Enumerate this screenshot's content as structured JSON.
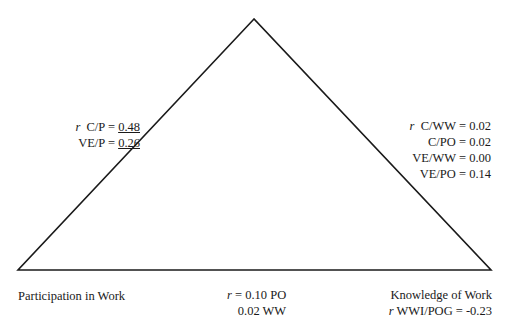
{
  "diagram": {
    "type": "triangle",
    "vertices": {
      "top": {
        "label": ""
      },
      "bottom_left": {
        "label": "Participation in Work"
      },
      "bottom_right": {
        "label": "Knowledge of Work"
      }
    },
    "line_color": "#1a1a1a"
  },
  "left_edge": {
    "r_symbol": "r",
    "rows": [
      {
        "name": "C/P = ",
        "value": "0.48",
        "underlined": true
      },
      {
        "name": "VE/P = ",
        "value": "0.26",
        "underlined": true
      }
    ]
  },
  "right_edge": {
    "r_symbol": "r",
    "rows": [
      {
        "name": "C/WW = ",
        "value": "0.02"
      },
      {
        "name": "C/PO = ",
        "value": "0.02"
      },
      {
        "name": "VE/WW = ",
        "value": "0.00"
      },
      {
        "name": "VE/PO = ",
        "value": "0.14"
      }
    ]
  },
  "bottom_edge": {
    "r_symbol": "r",
    "rows": [
      {
        "text": " = 0.10 PO"
      },
      {
        "text": "0.02 WW"
      }
    ]
  },
  "bottom_right_vertex": {
    "label": "Knowledge of Work",
    "r_symbol": "r",
    "stat": " WWI/POG = -0.23"
  }
}
